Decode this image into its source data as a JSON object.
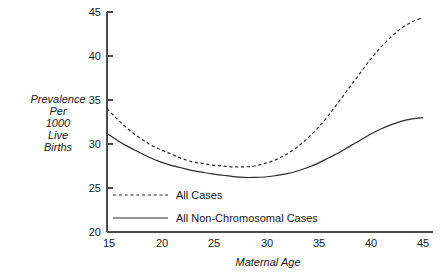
{
  "chart_data": {
    "type": "line",
    "title": "",
    "xlabel": "Maternal Age",
    "ylabel": "Prevalence Per 1000 Live Births",
    "xlim": [
      15,
      45
    ],
    "ylim": [
      20,
      45
    ],
    "grid": false,
    "legend_position": "inside-bottom-left",
    "x_ticks": [
      "15",
      "20",
      "25",
      "30",
      "35",
      "40",
      "45"
    ],
    "y_ticks": [
      "20",
      "25",
      "30",
      "35",
      "40",
      "45"
    ],
    "x": [
      15,
      16,
      17,
      18,
      19,
      20,
      21,
      22,
      23,
      24,
      25,
      26,
      27,
      28,
      29,
      30,
      31,
      32,
      33,
      34,
      35,
      36,
      37,
      38,
      39,
      40,
      41,
      42,
      43,
      44,
      45
    ],
    "series": [
      {
        "name": "All Cases",
        "style": "dashed",
        "color": "#2b2b2b",
        "values": [
          34.0,
          32.8,
          31.7,
          30.8,
          30.0,
          29.4,
          28.9,
          28.4,
          28.0,
          27.8,
          27.6,
          27.5,
          27.4,
          27.4,
          27.5,
          27.8,
          28.2,
          28.8,
          29.6,
          30.6,
          31.8,
          33.2,
          34.8,
          36.4,
          38.0,
          39.6,
          41.0,
          42.2,
          43.2,
          43.9,
          44.4
        ]
      },
      {
        "name": "All Non-Chromosomal Cases",
        "style": "solid",
        "color": "#2b2b2b",
        "values": [
          31.2,
          30.4,
          29.7,
          29.1,
          28.5,
          28.0,
          27.6,
          27.3,
          27.0,
          26.8,
          26.6,
          26.45,
          26.3,
          26.2,
          26.2,
          26.25,
          26.4,
          26.6,
          26.9,
          27.3,
          27.8,
          28.4,
          29.0,
          29.7,
          30.4,
          31.1,
          31.7,
          32.2,
          32.6,
          32.85,
          33.0
        ]
      }
    ],
    "y_axis_label_lines": [
      "Prevalence",
      "Per",
      "1000",
      "Live",
      "Births"
    ]
  },
  "axes": {
    "y_label_lines": [
      "Prevalence",
      "Per",
      "1000",
      "Live",
      "Births"
    ],
    "x_title": "Maternal Age",
    "x_tick_labels": [
      "15",
      "20",
      "25",
      "30",
      "35",
      "40",
      "45"
    ],
    "y_tick_labels": [
      "45",
      "40",
      "35",
      "30",
      "25",
      "20"
    ]
  },
  "legend": {
    "entries": [
      {
        "label": "All Cases",
        "style": "dashed"
      },
      {
        "label": "All Non-Chromosomal Cases",
        "style": "solid"
      }
    ]
  },
  "colors": {
    "line": "#2b2b2b",
    "axis": "#4a4a4a",
    "text": "#1a1a1a",
    "background": "#ffffff"
  }
}
